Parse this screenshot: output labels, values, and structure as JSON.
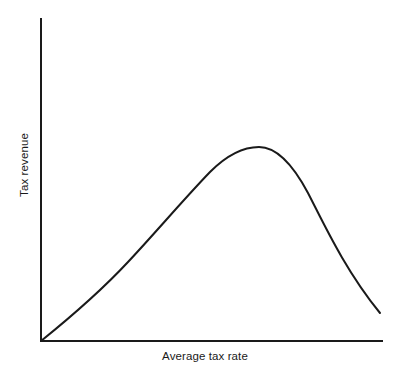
{
  "figure": {
    "title": "",
    "background_color": "#ffffff",
    "line_color": "#1a1a1a",
    "axis_color": "#1a1a1a"
  },
  "axes": {
    "x_label": "Average tax rate",
    "y_label": "Tax revenue"
  },
  "chart_data": {
    "type": "line",
    "title": "",
    "xlabel": "Average tax rate",
    "ylabel": "Tax revenue",
    "xlim": [
      0,
      1
    ],
    "ylim": [
      0,
      1
    ],
    "grid": false,
    "legend": "none",
    "ticks": {
      "x": [],
      "y": []
    },
    "annotations": [],
    "series": [
      {
        "name": "Laffer curve",
        "color": "#1a1a1a",
        "line_width": 2,
        "x": [
          0.0,
          0.05,
          0.1,
          0.15,
          0.2,
          0.26,
          0.32,
          0.38,
          0.44,
          0.5,
          0.56,
          0.64,
          0.7,
          0.76,
          0.82,
          0.88,
          0.94,
          1.0
        ],
        "y": [
          0.0,
          0.06,
          0.13,
          0.2,
          0.28,
          0.38,
          0.48,
          0.58,
          0.67,
          0.76,
          0.83,
          0.9,
          0.92,
          0.88,
          0.78,
          0.63,
          0.45,
          0.25
        ]
      }
    ],
    "peak": {
      "x": 0.675,
      "y": 0.92
    }
  },
  "geometry": {
    "origin_x": 41,
    "origin_y": 341,
    "y_axis_top": 18,
    "x_axis_right": 383,
    "curve_path": "M 41 341 C 72 316, 101 291, 128 262 C 157 231, 183 200, 210 172 C 228 154, 243 147, 259 147 C 276 147, 292 163, 308 193 C 324 224, 345 270, 380 313"
  }
}
